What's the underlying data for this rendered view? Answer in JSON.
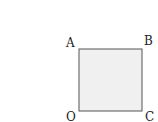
{
  "diagram": {
    "type": "square",
    "fill_color": "#f0f0f0",
    "stroke_color": "#555555",
    "vertices": [
      {
        "label": "A",
        "position": "top-left"
      },
      {
        "label": "B",
        "position": "top-right"
      },
      {
        "label": "O",
        "position": "bottom-left"
      },
      {
        "label": "C",
        "position": "bottom-right"
      }
    ]
  }
}
